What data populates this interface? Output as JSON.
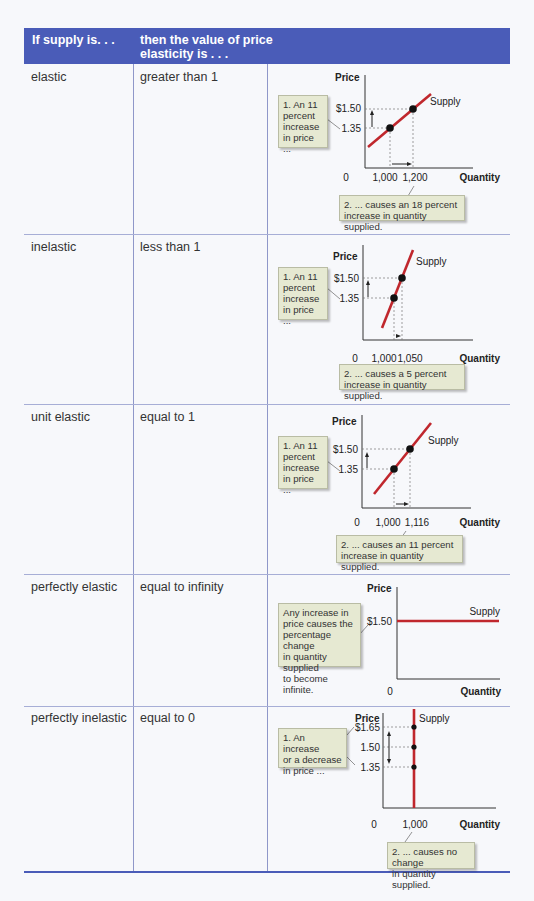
{
  "header": {
    "col1": "If supply is. . .",
    "col2_line1": "then the value of price",
    "col2_line2": "elasticity is . . ."
  },
  "rows": [
    {
      "supply": "elastic",
      "elasticity": "greater than 1",
      "chart": {
        "price_label": "Price",
        "quantity_label": "Quantity",
        "origin_label": "0",
        "curve_label": "Supply",
        "price_ticks": [
          "$1.50",
          "1.35"
        ],
        "quantity_ticks": [
          "1,000",
          "1,200"
        ],
        "callout_price": [
          "1. An 11",
          "percent",
          "increase",
          "in price ..."
        ],
        "callout_quantity": [
          "2.  ... causes an 18 percent",
          "increase in quantity supplied."
        ]
      }
    },
    {
      "supply": "inelastic",
      "elasticity": "less than 1",
      "chart": {
        "price_label": "Price",
        "quantity_label": "Quantity",
        "origin_label": "0",
        "curve_label": "Supply",
        "price_ticks": [
          "$1.50",
          "1.35"
        ],
        "quantity_ticks": [
          "1,000",
          "1,050"
        ],
        "callout_price": [
          "1. An 11",
          "percent",
          "increase",
          "in price ..."
        ],
        "callout_quantity": [
          "2.  ... causes a 5 percent",
          "increase in quantity supplied."
        ]
      }
    },
    {
      "supply": "unit elastic",
      "elasticity": "equal to 1",
      "chart": {
        "price_label": "Price",
        "quantity_label": "Quantity",
        "origin_label": "0",
        "curve_label": "Supply",
        "price_ticks": [
          "$1.50",
          "1.35"
        ],
        "quantity_ticks": [
          "1,000",
          "1,116"
        ],
        "callout_price": [
          "1. An 11",
          "percent",
          "increase",
          "in price ..."
        ],
        "callout_quantity": [
          "2.  ... causes an 11 percent",
          "increase in quantity supplied."
        ]
      }
    },
    {
      "supply": "perfectly elastic",
      "elasticity": "equal to infinity",
      "chart": {
        "price_label": "Price",
        "quantity_label": "Quantity",
        "origin_label": "0",
        "curve_label": "Supply",
        "price_ticks": [
          "$1.50"
        ],
        "callout_price": [
          "Any increase in",
          "price causes the",
          "percentage change",
          "in quantity supplied",
          "to become infinite."
        ]
      }
    },
    {
      "supply": "perfectly inelastic",
      "elasticity": "equal to 0",
      "chart": {
        "price_label": "Price",
        "quantity_label": "Quantity",
        "origin_label": "0",
        "curve_label": "Supply",
        "price_ticks": [
          "$1.65",
          "1.50",
          "1.35"
        ],
        "quantity_ticks": [
          "1,000"
        ],
        "callout_price": [
          "1. An increase",
          "or a decrease",
          "in price ..."
        ],
        "callout_quantity": [
          "2.  ... causes no change",
          "in quantity supplied."
        ]
      }
    }
  ],
  "colors": {
    "header_bg": "#4a5cb8",
    "supply_curve": "#c0272d",
    "callout_bg": "#e6e9d2"
  }
}
